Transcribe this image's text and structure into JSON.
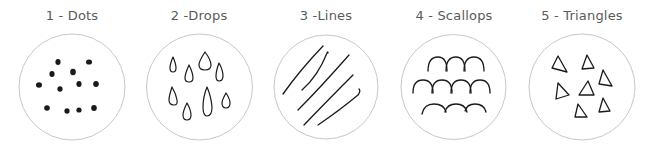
{
  "panels": [
    {
      "label": "1 - Dots",
      "pattern": "dots",
      "center_x": 72
    },
    {
      "label": "2 -Drops",
      "pattern": "drops",
      "center_x": 199
    },
    {
      "label": "3 -Lines",
      "pattern": "lines",
      "center_x": 326
    },
    {
      "label": "4 - Scallops",
      "pattern": "scallops",
      "center_x": 454
    },
    {
      "label": "5 - Triangles",
      "pattern": "triangles",
      "center_x": 582
    }
  ],
  "colors": {
    "circle_stroke": "#c8c8c8",
    "ink": "#1a1a1a",
    "label": "#5a5a5a"
  }
}
